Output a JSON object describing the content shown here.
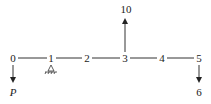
{
  "diagram": {
    "type": "beam-loading",
    "nodes": [
      {
        "label": "0",
        "x": 13
      },
      {
        "label": "1",
        "x": 51
      },
      {
        "label": "2",
        "x": 87
      },
      {
        "label": "3",
        "x": 125
      },
      {
        "label": "4",
        "x": 162
      },
      {
        "label": "5",
        "x": 199
      }
    ],
    "loads": [
      {
        "at_node": "0",
        "direction": "down",
        "label": "P"
      },
      {
        "at_node": "3",
        "direction": "up",
        "label": "10"
      },
      {
        "at_node": "5",
        "direction": "down",
        "label": "6"
      }
    ],
    "support": {
      "at_node": "1",
      "type": "pin"
    }
  }
}
